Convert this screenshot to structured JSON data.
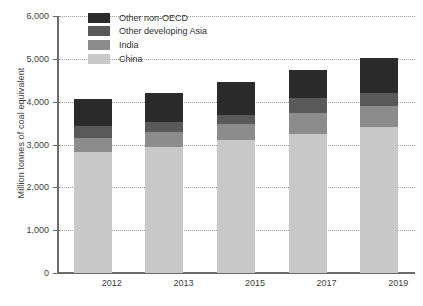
{
  "chart_data": {
    "type": "bar",
    "stacked": true,
    "title": "",
    "subtitle": "",
    "xlabel": "",
    "ylabel": "Million tonnes of coal equivalent",
    "categories": [
      "2012",
      "2013",
      "2015",
      "2017",
      "2019"
    ],
    "ylim": [
      0,
      6000
    ],
    "ytick_labels": [
      "0",
      "1,000",
      "2,000",
      "3,000",
      "4,000",
      "5,000",
      "6,000"
    ],
    "ytick_values": [
      0,
      1000,
      2000,
      3000,
      4000,
      5000,
      6000
    ],
    "grid": true,
    "legend_position": "top-left",
    "series": [
      {
        "name": "China",
        "color": "#c8c8c8",
        "values": [
          2820,
          2950,
          3100,
          3250,
          3400
        ]
      },
      {
        "name": "India",
        "color": "#8c8c8c",
        "values": [
          330,
          350,
          390,
          480,
          510
        ]
      },
      {
        "name": "Other developing Asia",
        "color": "#595959",
        "values": [
          280,
          220,
          190,
          350,
          290
        ]
      },
      {
        "name": "Other non-OECD",
        "color": "#2b2b2b",
        "values": [
          630,
          690,
          770,
          660,
          810
        ]
      }
    ],
    "totals": [
      4060,
      4210,
      4450,
      4740,
      5010
    ]
  },
  "legend": {
    "items": [
      {
        "label": "Other non-OECD",
        "color": "#2b2b2b"
      },
      {
        "label": "Other developing Asia",
        "color": "#595959"
      },
      {
        "label": "India",
        "color": "#8c8c8c"
      },
      {
        "label": "China",
        "color": "#c8c8c8"
      }
    ]
  },
  "colors": {
    "axis": "#6b6b6b",
    "grid": "#9a9a9a",
    "text": "#3d3d3d",
    "background": "#ffffff"
  }
}
